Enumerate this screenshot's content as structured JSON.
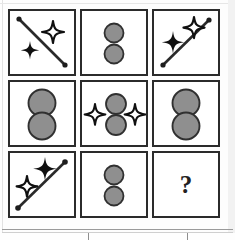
{
  "puzzle": {
    "type": "ravens-progressive-matrix",
    "title": "",
    "grid": {
      "rows": 3,
      "cols": 3
    },
    "answer_marker": "?",
    "colors": {
      "frame": "#2b2b2b",
      "cell_background": "#ffffff",
      "circle_fill": "#8f8f8f",
      "circle_stroke": "#303030",
      "star_filled": "#101010",
      "star_outline_fill": "#ffffff",
      "star_outline_stroke": "#101010",
      "line": "#2a2a2a",
      "question_mark": "#222222",
      "page_background": "#fdfdfd"
    },
    "cells": [
      {
        "index": 1,
        "position": "row1-col1",
        "name": "cell-r1c1",
        "description": "Diagonal line from top-left to bottom-right with round dots at both ends; one outlined four-point star at upper right and one filled four-point star at lower left.",
        "elements": [
          "diagonal-line-down",
          "dot-endpoint",
          "dot-endpoint",
          "star-outline",
          "star-filled"
        ],
        "shape_counts": {
          "lines": 1,
          "stars_filled": 1,
          "stars_outline": 1,
          "circles": 0
        }
      },
      {
        "index": 2,
        "position": "row1-col2",
        "name": "cell-r1c2",
        "description": "Two small gray circles stacked vertically near the centre with a gap between them.",
        "elements": [
          "circle-gray",
          "circle-gray"
        ],
        "shape_counts": {
          "lines": 0,
          "stars_filled": 0,
          "stars_outline": 0,
          "circles": 2
        }
      },
      {
        "index": 3,
        "position": "row1-col3",
        "name": "cell-r1c3",
        "description": "Diagonal line from bottom-left to top-right with round dots at both ends; outlined four-point star at upper right and filled four-point star at middle left.",
        "elements": [
          "diagonal-line-up",
          "dot-endpoint",
          "dot-endpoint",
          "star-outline",
          "star-filled"
        ],
        "shape_counts": {
          "lines": 1,
          "stars_filled": 1,
          "stars_outline": 1,
          "circles": 0
        }
      },
      {
        "index": 4,
        "position": "row2-col1",
        "name": "cell-r2c1",
        "description": "Two large gray circles stacked vertically and touching at the centre of the cell.",
        "elements": [
          "circle-gray-large",
          "circle-gray-large"
        ],
        "shape_counts": {
          "lines": 0,
          "stars_filled": 0,
          "stars_outline": 0,
          "circles": 2
        }
      },
      {
        "index": 5,
        "position": "row2-col2",
        "name": "cell-r2c2",
        "description": "Two gray circles stacked vertically, flanked by an outlined four-point star on the left and another on the right.",
        "elements": [
          "star-outline",
          "circle-gray",
          "circle-gray",
          "star-outline"
        ],
        "shape_counts": {
          "lines": 0,
          "stars_filled": 0,
          "stars_outline": 2,
          "circles": 2
        }
      },
      {
        "index": 6,
        "position": "row2-col3",
        "name": "cell-r2c3",
        "description": "Two large gray circles stacked vertically and touching at the centre of the cell.",
        "elements": [
          "circle-gray-large",
          "circle-gray-large"
        ],
        "shape_counts": {
          "lines": 0,
          "stars_filled": 0,
          "stars_outline": 0,
          "circles": 2
        }
      },
      {
        "index": 7,
        "position": "row3-col1",
        "name": "cell-r3c1",
        "description": "Diagonal line from bottom-left to top-right with round dots at both ends; filled four-point star at upper middle and outlined four-point star at lower left.",
        "elements": [
          "diagonal-line-up",
          "dot-endpoint",
          "dot-endpoint",
          "star-filled",
          "star-outline"
        ],
        "shape_counts": {
          "lines": 1,
          "stars_filled": 1,
          "stars_outline": 1,
          "circles": 0
        }
      },
      {
        "index": 8,
        "position": "row3-col2",
        "name": "cell-r3c2",
        "description": "Two small gray circles stacked vertically near the centre with a gap between them.",
        "elements": [
          "circle-gray",
          "circle-gray"
        ],
        "shape_counts": {
          "lines": 0,
          "stars_filled": 0,
          "stars_outline": 0,
          "circles": 2
        }
      },
      {
        "index": 9,
        "position": "row3-col3",
        "name": "cell-answer",
        "description": "Empty answer cell containing a bold question mark.",
        "elements": [
          "question-mark"
        ],
        "shape_counts": {
          "lines": 0,
          "stars_filled": 0,
          "stars_outline": 0,
          "circles": 0
        }
      }
    ]
  },
  "answer_strip": {
    "name": "answer-options-strip",
    "visible_label": "",
    "option_divider_count": 2
  }
}
